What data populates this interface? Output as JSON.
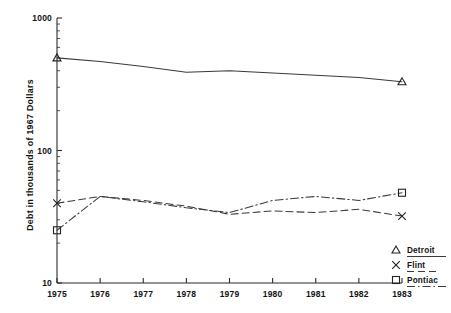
{
  "chart_data": {
    "type": "line",
    "title": "",
    "xlabel": "",
    "ylabel": "Debt in thousands of 1967 Dollars",
    "x": [
      1975,
      1976,
      1977,
      1978,
      1979,
      1980,
      1981,
      1982,
      1983
    ],
    "xticklabels": [
      "1975",
      "1976",
      "1977",
      "1978",
      "1979",
      "1980",
      "1981",
      "1982",
      "1983"
    ],
    "xlim": [
      1975,
      1983
    ],
    "yscale": "log",
    "ylim": [
      10,
      1000
    ],
    "yticklabels": [
      "1000",
      "100",
      "10"
    ],
    "ytickvalues": [
      1000,
      100,
      10
    ],
    "grid": false,
    "legend_position": "right-bottom",
    "series": [
      {
        "name": "Detroit",
        "marker": "triangle",
        "linestyle": "solid",
        "values": [
          500,
          470,
          430,
          390,
          400,
          385,
          370,
          355,
          330
        ]
      },
      {
        "name": "Flint",
        "marker": "x",
        "linestyle": "dashed",
        "values": [
          40,
          45,
          42,
          38,
          33,
          35,
          34,
          36,
          32
        ]
      },
      {
        "name": "Pontiac",
        "marker": "square",
        "linestyle": "dashdot",
        "values": [
          25,
          45,
          41,
          37,
          34,
          42,
          45,
          42,
          48
        ]
      }
    ]
  },
  "legend": {
    "entries": [
      {
        "label": "Detroit",
        "marker": "triangle",
        "linestyle": "solid"
      },
      {
        "label": "Flint",
        "marker": "x",
        "linestyle": "dashed"
      },
      {
        "label": "Pontiac",
        "marker": "square",
        "linestyle": "dashdot"
      }
    ]
  },
  "colors": {
    "line": "#3a3a3a",
    "axis": "#2b2b2b",
    "text": "#111111",
    "background": "#ffffff"
  }
}
